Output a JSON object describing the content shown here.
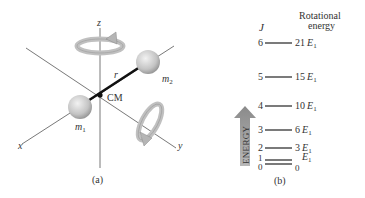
{
  "panel_a": {
    "caption": "(a)",
    "axes": {
      "x": "x",
      "y": "y",
      "z": "z"
    },
    "labels": {
      "m1": "m",
      "m1_sub": "1",
      "m2": "m",
      "m2_sub": "2",
      "r": "r",
      "cm": "CM"
    }
  },
  "panel_b": {
    "caption": "(b)",
    "col_j": "J",
    "col_energy_line1": "Rotational",
    "col_energy_line2": "energy",
    "arrow_label": "ENERGY",
    "levels": [
      {
        "j": "6",
        "energy": "21",
        "unit": "E",
        "sub": "1"
      },
      {
        "j": "5",
        "energy": "15",
        "unit": "E",
        "sub": "1"
      },
      {
        "j": "4",
        "energy": "10",
        "unit": "E",
        "sub": "1"
      },
      {
        "j": "3",
        "energy": "6",
        "unit": "E",
        "sub": "1"
      },
      {
        "j": "2",
        "energy": "3",
        "unit": "E",
        "sub": "1"
      },
      {
        "j": "1",
        "energy": "",
        "unit": "E",
        "sub": "1"
      },
      {
        "j": "0",
        "energy": "0",
        "unit": "",
        "sub": ""
      }
    ]
  }
}
